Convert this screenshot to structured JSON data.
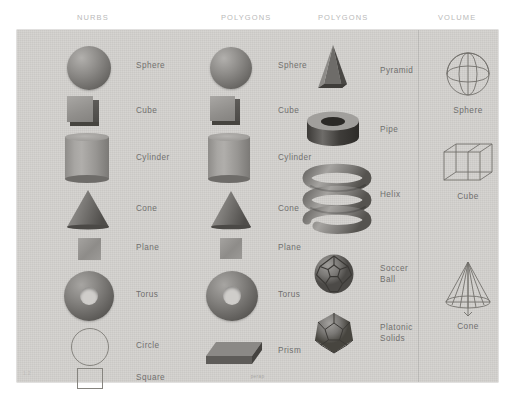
{
  "figure": {
    "background_color": "#ffffff",
    "panel_color": "#d2d0cd",
    "label_color": "#706f6e",
    "header_color": "#b9b9b9"
  },
  "headers": [
    {
      "label": "NURBS"
    },
    {
      "label": "POLYGONS"
    },
    {
      "label": "POLYGONS"
    },
    {
      "label": "VOLUME"
    }
  ],
  "columns": [
    {
      "name": "nurbs",
      "header": "NURBS",
      "items": [
        {
          "label": "Sphere",
          "icon": "sphere-shape"
        },
        {
          "label": "Cube",
          "icon": "cube-shape"
        },
        {
          "label": "Cylinder",
          "icon": "cylinder-shape"
        },
        {
          "label": "Cone",
          "icon": "cone-shape"
        },
        {
          "label": "Plane",
          "icon": "plane-shape"
        },
        {
          "label": "Torus",
          "icon": "torus-shape"
        },
        {
          "label": "Circle",
          "icon": "circle-outline-shape"
        },
        {
          "label": "Square",
          "icon": "square-outline-shape"
        }
      ]
    },
    {
      "name": "polygons-primitives",
      "header": "POLYGONS",
      "items": [
        {
          "label": "Sphere",
          "icon": "sphere-shape"
        },
        {
          "label": "Cube",
          "icon": "cube-shape"
        },
        {
          "label": "Cylinder",
          "icon": "cylinder-shape"
        },
        {
          "label": "Cone",
          "icon": "cone-shape"
        },
        {
          "label": "Plane",
          "icon": "plane-shape"
        },
        {
          "label": "Torus",
          "icon": "torus-shape"
        },
        {
          "label": "Prism",
          "icon": "prism-shape"
        }
      ]
    },
    {
      "name": "polygons-advanced",
      "header": "POLYGONS",
      "items": [
        {
          "label": "Pyramid",
          "icon": "pyramid-shape"
        },
        {
          "label": "Pipe",
          "icon": "pipe-shape"
        },
        {
          "label": "Helix",
          "icon": "helix-shape"
        },
        {
          "label": "Soccer\nBall",
          "icon": "soccer-ball-shape"
        },
        {
          "label": "Platonic\nSolids",
          "icon": "platonic-solid-shape"
        }
      ]
    },
    {
      "name": "volume",
      "header": "VOLUME",
      "items": [
        {
          "label": "Sphere",
          "icon": "wireframe-sphere-shape"
        },
        {
          "label": "Cube",
          "icon": "wireframe-cube-shape"
        },
        {
          "label": "Cone",
          "icon": "wireframe-cone-shape"
        }
      ]
    }
  ],
  "marks": {
    "corner_mark": "1.2",
    "bottom_caption": "perap"
  }
}
